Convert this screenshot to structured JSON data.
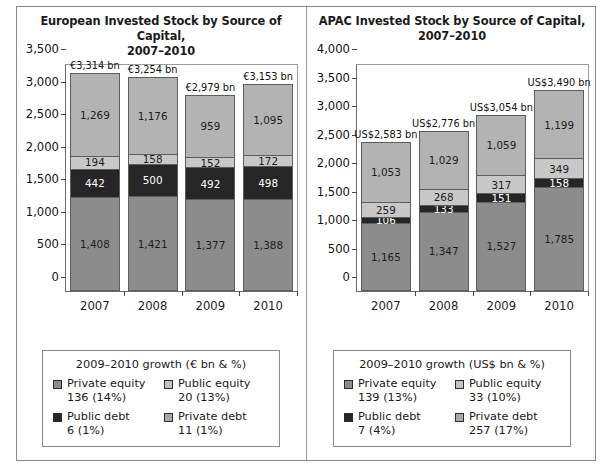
{
  "figure": {
    "panels": [
      {
        "id": "european",
        "title_line1": "European Invested Stock by Source of Capital,",
        "title_line2": "2007–2010",
        "legend": {
          "title": "2009–2010 growth (€ bn & %)",
          "items": [
            {
              "label": "Private equity",
              "value": "136 (14%)",
              "color": "#8c8c8c"
            },
            {
              "label": "Public equity",
              "value": "20 (13%)",
              "color": "#c2c2c2"
            },
            {
              "label": "Public debt",
              "value": "6 (1%)",
              "color": "#262626"
            },
            {
              "label": "Private debt",
              "value": "11 (1%)",
              "color": "#a8a8a8"
            }
          ]
        },
        "chart_data": {
          "type": "bar",
          "subtype": "stacked",
          "title": "European Invested Stock by Source of Capital, 2007–2010",
          "xlabel": "",
          "ylabel": "",
          "units": "€ bn",
          "ylim": [
            0,
            3500
          ],
          "yticks": [
            "0",
            "500",
            "1,000",
            "1,500",
            "2,000",
            "2,500",
            "3,000",
            "3,500"
          ],
          "ytick_values": [
            0,
            500,
            1000,
            1500,
            2000,
            2500,
            3000,
            3500
          ],
          "grid": false,
          "legend_position": "below",
          "categories": [
            "2007",
            "2008",
            "2009",
            "2010"
          ],
          "series": [
            {
              "name": "Private equity",
              "color": "#8c8c8c",
              "text_on_dark": false,
              "values": [
                1408,
                1421,
                1377,
                1388
              ],
              "labels": [
                "1,408",
                "1,421",
                "1,377",
                "1,388"
              ]
            },
            {
              "name": "Public debt",
              "color": "#262626",
              "text_on_dark": true,
              "values": [
                442,
                500,
                492,
                498
              ],
              "labels": [
                "442",
                "500",
                "492",
                "498"
              ]
            },
            {
              "name": "Private debt",
              "color": "#c8c8c8",
              "text_on_dark": false,
              "values": [
                194,
                158,
                152,
                172
              ],
              "labels": [
                "194",
                "158",
                "152",
                "172"
              ]
            },
            {
              "name": "Public equity",
              "color": "#b3b3b3",
              "text_on_dark": false,
              "values": [
                1269,
                1176,
                959,
                1095
              ],
              "labels": [
                "1,269",
                "1,176",
                "959",
                "1,095"
              ]
            }
          ],
          "totals": [
            3314,
            3254,
            2979,
            3153
          ],
          "total_labels": [
            "€3,314 bn",
            "€3,254 bn",
            "€2,979 bn",
            "€3,153 bn"
          ]
        }
      },
      {
        "id": "apac",
        "title_line1": "APAC Invested Stock by Source of Capital,",
        "title_line2": "2007–2010",
        "legend": {
          "title": "2009–2010 growth (US$ bn & %)",
          "items": [
            {
              "label": "Private equity",
              "value": "139 (13%)",
              "color": "#8c8c8c"
            },
            {
              "label": "Public equity",
              "value": "33 (10%)",
              "color": "#c2c2c2"
            },
            {
              "label": "Public debt",
              "value": "7 (4%)",
              "color": "#262626"
            },
            {
              "label": "Private debt",
              "value": "257 (17%)",
              "color": "#a8a8a8"
            }
          ]
        },
        "chart_data": {
          "type": "bar",
          "subtype": "stacked",
          "title": "APAC Invested Stock by Source of Capital, 2007–2010",
          "xlabel": "",
          "ylabel": "",
          "units": "US$ bn",
          "ylim": [
            0,
            4000
          ],
          "yticks": [
            "0",
            "500",
            "1,000",
            "1,500",
            "2,000",
            "2,500",
            "3,000",
            "3,500",
            "4,000"
          ],
          "ytick_values": [
            0,
            500,
            1000,
            1500,
            2000,
            2500,
            3000,
            3500,
            4000
          ],
          "grid": false,
          "legend_position": "below",
          "categories": [
            "2007",
            "2008",
            "2009",
            "2010"
          ],
          "series": [
            {
              "name": "Private equity",
              "color": "#8c8c8c",
              "text_on_dark": false,
              "values": [
                1165,
                1347,
                1527,
                1785
              ],
              "labels": [
                "1,165",
                "1,347",
                "1,527",
                "1,785"
              ]
            },
            {
              "name": "Public debt",
              "color": "#262626",
              "text_on_dark": true,
              "values": [
                106,
                133,
                151,
                158
              ],
              "labels": [
                "106",
                "133",
                "151",
                "158"
              ]
            },
            {
              "name": "Private debt",
              "color": "#c8c8c8",
              "text_on_dark": false,
              "values": [
                259,
                268,
                317,
                349
              ],
              "labels": [
                "259",
                "268",
                "317",
                "349"
              ]
            },
            {
              "name": "Public equity",
              "color": "#b3b3b3",
              "text_on_dark": false,
              "values": [
                1053,
                1029,
                1059,
                1199
              ],
              "labels": [
                "1,053",
                "1,029",
                "1,059",
                "1,199"
              ]
            }
          ],
          "totals": [
            2583,
            2776,
            3054,
            3490
          ],
          "total_labels": [
            "US$2,583 bn",
            "US$2,776 bn",
            "US$3,054 bn",
            "US$3,490 bn"
          ]
        }
      }
    ]
  }
}
